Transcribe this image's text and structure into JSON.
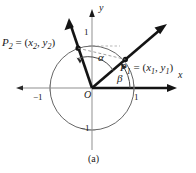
{
  "figure": {
    "caption": "(a)",
    "axes": {
      "x_label": "x",
      "y_label": "y",
      "origin_label": "O",
      "ticks": {
        "x_negative": "−1",
        "x_positive": "1",
        "y_positive": "1",
        "y_negative": "−1"
      }
    },
    "points": {
      "p2": {
        "name": "P",
        "subscript": "2",
        "equals": "=",
        "open_paren": "(",
        "coord_x": "x",
        "coord_x_sub": "2",
        "comma": ",",
        "coord_y": "y",
        "coord_y_sub": "2",
        "close_paren": ")"
      },
      "p1": {
        "name": "P",
        "subscript": "1",
        "equals": "=",
        "open_paren": "(",
        "coord_x": "x",
        "coord_x_sub": "1",
        "comma": ",",
        "coord_y": "y",
        "coord_y_sub": "1",
        "close_paren": ")"
      }
    },
    "angles": {
      "alpha": "α",
      "beta": "β"
    },
    "colors": {
      "ink": "#1a1a1a",
      "circle": "#555555",
      "axis": "#8a8a8a",
      "dashed": "#8a8a8a",
      "background": "#ffffff"
    }
  }
}
